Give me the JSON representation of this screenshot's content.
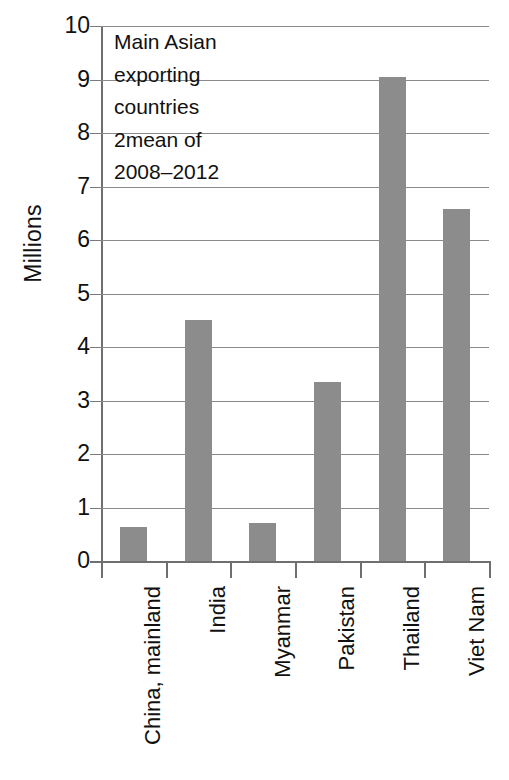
{
  "chart_data": {
    "type": "bar",
    "title": "",
    "xlabel": "",
    "ylabel": "Millions",
    "categories": [
      "China, mainland",
      "India",
      "Myanmar",
      "Pakistan",
      "Thailand",
      "Viet Nam"
    ],
    "values": [
      0.64,
      4.5,
      0.71,
      3.35,
      9.05,
      6.58
    ],
    "ylim": [
      0,
      10
    ],
    "ytick_labels": [
      "10",
      "9",
      "8",
      "7",
      "6",
      "5",
      "4",
      "3",
      "2",
      "1",
      "0"
    ],
    "ytick_values": [
      10,
      9,
      8,
      7,
      6,
      5,
      4,
      3,
      2,
      1,
      0
    ],
    "grid": true,
    "legend": "none",
    "bar_color": "#8c8c8c",
    "axis_color": "#6f6f6f",
    "grid_color": "#8a8a8a",
    "annotation_lines": [
      "Main Asian",
      "exporting",
      "countries",
      "2mean of",
      "2008–2012"
    ]
  }
}
